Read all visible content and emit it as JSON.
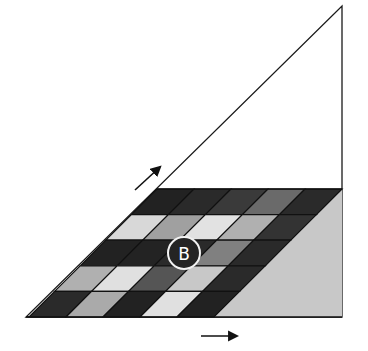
{
  "diagram": {
    "triangle": {
      "apex": [
        342,
        6
      ],
      "bottom_left": [
        26,
        317
      ],
      "bottom_right": [
        342,
        317
      ],
      "fill": "#ffffff",
      "stroke": "#1a1a1a"
    },
    "grid": {
      "top_y": 189,
      "bottom_y": 317,
      "rows": 5,
      "cols": 5,
      "top_left_x": 157,
      "col_width": 37,
      "shear_per_px": 1.0,
      "cell_colors": [
        [
          "#222222",
          "#2a2a2a",
          "#3a3a3a",
          "#6a6a6a",
          "#2a2a2a"
        ],
        [
          "#d8d8d8",
          "#a0a0a0",
          "#e2e2e2",
          "#b0b0b0",
          "#333333"
        ],
        [
          "#222222",
          "#232323",
          "#2a2a2a",
          "#808080",
          "#2a2a2a"
        ],
        [
          "#b0b0b0",
          "#e0e0e0",
          "#555555",
          "#c8c8c8",
          "#2a2a2a"
        ],
        [
          "#2a2a2a",
          "#aaaaaa",
          "#222222",
          "#e0e0e0",
          "#222222"
        ]
      ]
    },
    "shaded_region": {
      "fill": "#c8c8c8"
    },
    "marker": {
      "label": "B",
      "cx": 184,
      "cy": 253,
      "r": 16
    },
    "arrows": [
      {
        "name": "diagonal-arrow",
        "from": [
          135,
          190
        ],
        "to": [
          160,
          167
        ]
      },
      {
        "name": "horizontal-arrow",
        "from": [
          201,
          336
        ],
        "to": [
          237,
          336
        ]
      }
    ]
  }
}
